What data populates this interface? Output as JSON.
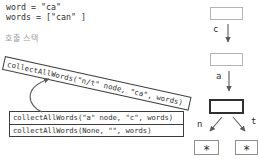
{
  "canvas": {
    "width": 259,
    "height": 159
  },
  "colors": {
    "background": "#ffffff",
    "ink": "#2f2f2f",
    "muted_label": "#9c9c9c",
    "frame_border": "#3d3d3d",
    "node_border": "#b3b3b3",
    "active_node_border": "#2f2f2f",
    "arrow": "#5a5a5a"
  },
  "variables": {
    "word_line": "word = \"ca\"",
    "words_line": "words = [\"can\" ]"
  },
  "call_stack": {
    "label": "호출 스택",
    "active_frame": "collectAllWords(\"n/t\" node, \"ca\", words)",
    "frames": [
      "collectAllWords(\"a\" node, \"c\", words)",
      "collectAllWords(None, \"\", words)"
    ]
  },
  "trie": {
    "edge_labels": {
      "c": "c",
      "a": "a",
      "n": "n",
      "t": "t"
    },
    "leaf_symbol": "*"
  }
}
